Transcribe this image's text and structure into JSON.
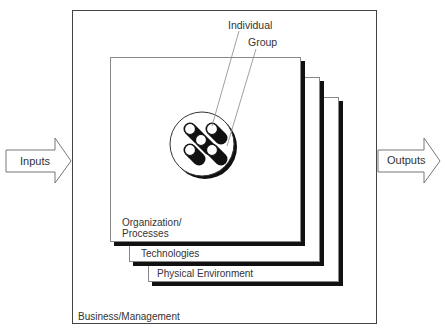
{
  "diagram": {
    "type": "nested-layers-system-model",
    "inputs_label": "Inputs",
    "outputs_label": "Outputs",
    "outer_box_label": "Business/Management",
    "layers": [
      {
        "label_line1": "Organization/",
        "label_line2": "Processes"
      },
      {
        "label_line1": "Technologies"
      },
      {
        "label_line1": "Physical Environment"
      }
    ],
    "core": {
      "individual_label": "Individual",
      "group_label": "Group",
      "member_count": 5
    },
    "colors": {
      "line": "#444444",
      "shadow": "#111111",
      "fill": "#ffffff",
      "text": "#333333"
    }
  }
}
